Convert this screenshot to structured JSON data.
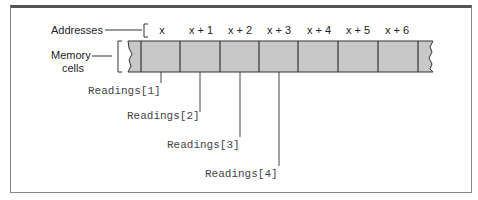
{
  "diagram": {
    "labels": {
      "addresses": "Addresses",
      "memory_line1": "Memory",
      "memory_line2": "cells"
    },
    "addresses": [
      "x",
      "x + 1",
      "x + 2",
      "x + 3",
      "x + 4",
      "x + 5",
      "x + 6"
    ],
    "readings": [
      "Readings[1]",
      "Readings[2]",
      "Readings[3]",
      "Readings[4]"
    ],
    "colors": {
      "cell_fill": "#c8c8c8",
      "cell_stroke": "#333333",
      "frame": "#555555"
    }
  }
}
